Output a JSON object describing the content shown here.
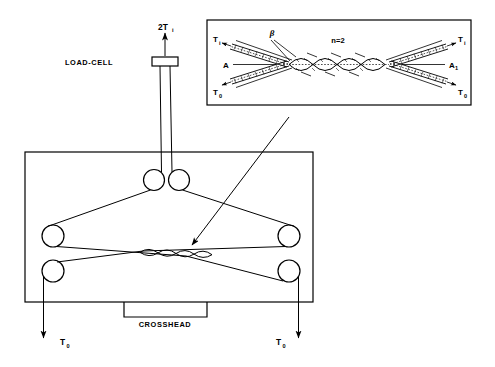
{
  "figure": {
    "background_color": "#ffffff",
    "line_color": "#000000"
  },
  "main_diagram": {
    "load_cell_label": "LOAD-CELL",
    "load_cell_force_label": "2T",
    "load_cell_force_sub": "i",
    "crosshead_label": "CROSSHEAD",
    "output_tension_left_label": "T",
    "output_tension_left_sub": "0",
    "output_tension_right_label": "T",
    "output_tension_right_sub": "0",
    "pulley_count": 6,
    "twist_loop_count": 4
  },
  "inset": {
    "twist_count_label": "n=2",
    "angle_label": "β",
    "strand_left_label": "A",
    "strand_right_label": "A",
    "strand_right_sub": "1",
    "tension_in_left_label": "T",
    "tension_in_left_sub": "i",
    "tension_in_right_label": "T",
    "tension_in_right_sub": "i",
    "tension_out_left_label": "T",
    "tension_out_left_sub": "0",
    "tension_out_right_label": "T",
    "tension_out_right_sub": "0",
    "loop_count": 4
  }
}
